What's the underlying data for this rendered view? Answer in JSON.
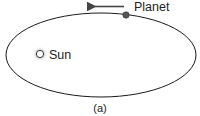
{
  "diagram": {
    "labels": {
      "planet": "Planet",
      "sun": "Sun",
      "caption": "(a)"
    },
    "colors": {
      "orbit": "#1a1a1a",
      "planet": "#555555",
      "sun_glow": "#c8c8c8",
      "arrow": "#444444"
    }
  }
}
